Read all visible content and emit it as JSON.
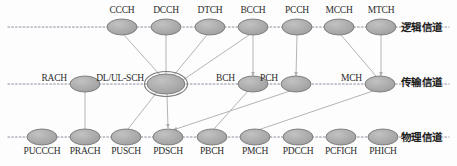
{
  "diagram": {
    "colors": {
      "node_fill": "#a8a8a8",
      "node_stroke": "#6f6f6f",
      "highlight_stroke": "#7a7a7a",
      "edge": "#b4b4b4",
      "axis": "#8e8ea0",
      "text": "#2b2b2b"
    },
    "rows": [
      {
        "id": "logical",
        "label": "逻辑信道",
        "label_x": 401,
        "label_y": 19,
        "axis_y": 27,
        "nodes": [
          {
            "id": "CCCH",
            "label": "CCCH",
            "cx": 122,
            "cy": 27,
            "rx": 15,
            "ry": 8,
            "label_y": 5,
            "highlight": false
          },
          {
            "id": "DCCH",
            "label": "DCCH",
            "cx": 166,
            "cy": 27,
            "rx": 15,
            "ry": 8,
            "label_y": 5,
            "highlight": false
          },
          {
            "id": "DTCH",
            "label": "DTCH",
            "cx": 210,
            "cy": 27,
            "rx": 15,
            "ry": 8,
            "label_y": 5,
            "highlight": false
          },
          {
            "id": "BCCH",
            "label": "BCCH",
            "cx": 253,
            "cy": 27,
            "rx": 15,
            "ry": 8,
            "label_y": 5,
            "highlight": false
          },
          {
            "id": "PCCH",
            "label": "PCCH",
            "cx": 297,
            "cy": 27,
            "rx": 15,
            "ry": 8,
            "label_y": 5,
            "highlight": false
          },
          {
            "id": "MCCH",
            "label": "MCCH",
            "cx": 339,
            "cy": 27,
            "rx": 15,
            "ry": 8,
            "label_y": 5,
            "highlight": false
          },
          {
            "id": "MTCH",
            "label": "MTCH",
            "cx": 381,
            "cy": 27,
            "rx": 15,
            "ry": 8,
            "label_y": 5,
            "highlight": false
          }
        ]
      },
      {
        "id": "transport",
        "label": "传输信道",
        "label_x": 401,
        "label_y": 74,
        "axis_y": 84,
        "nodes": [
          {
            "id": "RACH",
            "label": "RACH",
            "cx": 85,
            "cy": 84,
            "rx": 15,
            "ry": 8,
            "label_side": "left",
            "highlight": false
          },
          {
            "id": "DL/UL-SCH",
            "label": "DL/UL-SCH",
            "cx": 166,
            "cy": 84,
            "rx": 19,
            "ry": 10,
            "label_side": "left",
            "highlight": true
          },
          {
            "id": "BCH",
            "label": "BCH",
            "cx": 253,
            "cy": 84,
            "rx": 15,
            "ry": 8,
            "label_side": "left",
            "highlight": false
          },
          {
            "id": "PCH",
            "label": "PCH",
            "cx": 296,
            "cy": 84,
            "rx": 15,
            "ry": 8,
            "label_side": "left",
            "highlight": false
          },
          {
            "id": "MCH",
            "label": "MCH",
            "cx": 380,
            "cy": 84,
            "rx": 15,
            "ry": 8,
            "label_side": "left",
            "highlight": false
          }
        ]
      },
      {
        "id": "physical",
        "label": "物理信道",
        "label_x": 401,
        "label_y": 129,
        "axis_y": 137,
        "nodes": [
          {
            "id": "PUCCCH",
            "label": "PUCCCH",
            "cx": 42,
            "cy": 137,
            "rx": 15,
            "ry": 8,
            "label_y": 146,
            "highlight": false
          },
          {
            "id": "PRACH",
            "label": "PRACH",
            "cx": 85,
            "cy": 137,
            "rx": 15,
            "ry": 8,
            "label_y": 146,
            "highlight": false
          },
          {
            "id": "PUSCH",
            "label": "PUSCH",
            "cx": 126,
            "cy": 137,
            "rx": 15,
            "ry": 8,
            "label_y": 146,
            "highlight": false
          },
          {
            "id": "PDSCH",
            "label": "PDSCH",
            "cx": 168,
            "cy": 137,
            "rx": 15,
            "ry": 8,
            "label_y": 146,
            "highlight": false
          },
          {
            "id": "PBCH",
            "label": "PBCH",
            "cx": 212,
            "cy": 137,
            "rx": 15,
            "ry": 8,
            "label_y": 146,
            "highlight": false
          },
          {
            "id": "PMCH",
            "label": "PMCH",
            "cx": 255,
            "cy": 137,
            "rx": 15,
            "ry": 8,
            "label_y": 146,
            "highlight": false
          },
          {
            "id": "PDCCH",
            "label": "PDCCH",
            "cx": 298,
            "cy": 137,
            "rx": 15,
            "ry": 8,
            "label_y": 146,
            "highlight": false
          },
          {
            "id": "PCFICH",
            "label": "PCFICH",
            "cx": 341,
            "cy": 137,
            "rx": 15,
            "ry": 8,
            "label_y": 146,
            "highlight": false
          },
          {
            "id": "PHICH",
            "label": "PHICH",
            "cx": 383,
            "cy": 137,
            "rx": 15,
            "ry": 8,
            "label_y": 146,
            "highlight": false
          }
        ]
      }
    ],
    "edges": [
      {
        "from": "CCCH",
        "to": "DL/UL-SCH",
        "x1": 124,
        "y1": 35,
        "x2": 160,
        "y2": 75,
        "arrow": false
      },
      {
        "from": "DCCH",
        "to": "DL/UL-SCH",
        "x1": 166,
        "y1": 35,
        "x2": 166,
        "y2": 74,
        "arrow": false
      },
      {
        "from": "DTCH",
        "to": "DL/UL-SCH",
        "x1": 207,
        "y1": 35,
        "x2": 174,
        "y2": 75,
        "arrow": false
      },
      {
        "from": "BCCH",
        "to": "DL/UL-SCH",
        "x1": 249,
        "y1": 35,
        "x2": 180,
        "y2": 82,
        "arrow": true
      },
      {
        "from": "BCCH",
        "to": "BCH",
        "x1": 253,
        "y1": 35,
        "x2": 253,
        "y2": 76,
        "arrow": true
      },
      {
        "from": "PCCH",
        "to": "PCH",
        "x1": 297,
        "y1": 35,
        "x2": 296,
        "y2": 76,
        "arrow": true
      },
      {
        "from": "MCCH",
        "to": "MCH",
        "x1": 341,
        "y1": 35,
        "x2": 376,
        "y2": 76,
        "arrow": false
      },
      {
        "from": "MTCH",
        "to": "MCH",
        "x1": 381,
        "y1": 35,
        "x2": 381,
        "y2": 76,
        "arrow": true
      },
      {
        "from": "RACH",
        "to": "PRACH",
        "x1": 85,
        "y1": 92,
        "x2": 85,
        "y2": 129,
        "arrow": false
      },
      {
        "from": "DL/UL-SCH",
        "to": "PUSCH",
        "x1": 157,
        "y1": 92,
        "x2": 128,
        "y2": 129,
        "arrow": false
      },
      {
        "from": "DL/UL-SCH",
        "to": "PDSCH",
        "x1": 167,
        "y1": 94,
        "x2": 168,
        "y2": 128,
        "arrow": true
      },
      {
        "from": "BCH",
        "to": "PBCH",
        "x1": 248,
        "y1": 91,
        "x2": 214,
        "y2": 129,
        "arrow": false
      },
      {
        "from": "PCH",
        "to": "PDSCH",
        "x1": 290,
        "y1": 91,
        "x2": 173,
        "y2": 130,
        "arrow": true
      },
      {
        "from": "MCH",
        "to": "PMCH",
        "x1": 373,
        "y1": 91,
        "x2": 258,
        "y2": 130,
        "arrow": false
      }
    ]
  }
}
